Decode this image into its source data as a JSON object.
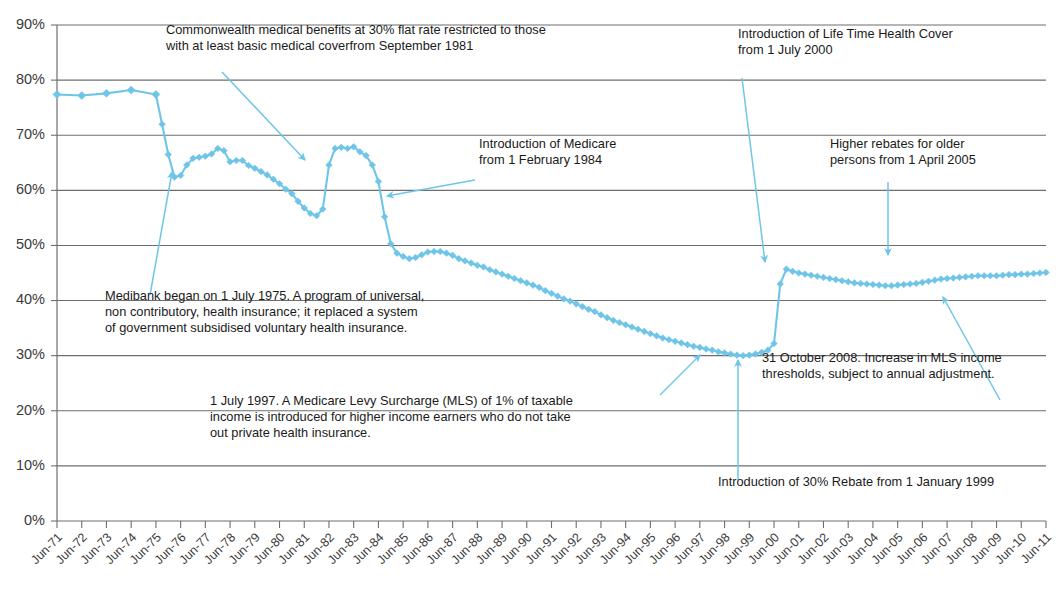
{
  "chart_data": {
    "type": "line",
    "title": "",
    "subtitle": "",
    "xlabel": "",
    "ylabel": "",
    "ylim": [
      0,
      90
    ],
    "yticks": [
      0,
      10,
      20,
      30,
      40,
      50,
      60,
      70,
      80,
      90
    ],
    "ytick_labels": [
      "0%",
      "10%",
      "20%",
      "30%",
      "40%",
      "50%",
      "60%",
      "70%",
      "80%",
      "90%"
    ],
    "grid": true,
    "legend": "none",
    "series_color": "#6FC5E8",
    "marker": "diamond",
    "categories": [
      "Jun-71",
      "Jun-72",
      "Jun-73",
      "Jun-74",
      "Jun-75",
      "Jun-76",
      "Jun-77",
      "Jun-78",
      "Jun-79",
      "Jun-80",
      "Jun-81",
      "Jun-82",
      "Jun-83",
      "Jun-84",
      "Jun-85",
      "Jun-86",
      "Jun-87",
      "Jun-88",
      "Jun-89",
      "Jun-90",
      "Jun-91",
      "Jun-92",
      "Jun-93",
      "Jun-94",
      "Jun-95",
      "Jun-96",
      "Jun-97",
      "Jun-98",
      "Jun-99",
      "Jun-00",
      "Jun-01",
      "Jun-02",
      "Jun-03",
      "Jun-04",
      "Jun-05",
      "Jun-06",
      "Jun-07",
      "Jun-08",
      "Jun-09",
      "Jun-10",
      "Jun-11"
    ],
    "series": [
      {
        "name": "Persons covered by private health insurance (hospital treatment)",
        "points": [
          {
            "x": "Jun-71",
            "y": 77.4
          },
          {
            "x": "Jun-72",
            "y": 77.2
          },
          {
            "x": "Jun-73",
            "y": 77.6
          },
          {
            "x": "Jun-74",
            "y": 78.2
          },
          {
            "x": "Jun-75",
            "y": 77.4
          },
          {
            "x": "Sep-75",
            "y": 72.0
          },
          {
            "x": "Dec-75",
            "y": 66.5
          },
          {
            "x": "Mar-76",
            "y": 62.4
          },
          {
            "x": "Jun-76",
            "y": 62.7
          },
          {
            "x": "Sep-76",
            "y": 64.6
          },
          {
            "x": "Dec-76",
            "y": 65.8
          },
          {
            "x": "Mar-77",
            "y": 66.0
          },
          {
            "x": "Jun-77",
            "y": 66.2
          },
          {
            "x": "Sep-77",
            "y": 66.6
          },
          {
            "x": "Dec-77",
            "y": 67.6
          },
          {
            "x": "Mar-78",
            "y": 67.2
          },
          {
            "x": "Jun-78",
            "y": 65.2
          },
          {
            "x": "Sep-78",
            "y": 65.4
          },
          {
            "x": "Dec-78",
            "y": 65.4
          },
          {
            "x": "Mar-79",
            "y": 64.5
          },
          {
            "x": "Jun-79",
            "y": 64.0
          },
          {
            "x": "Sep-79",
            "y": 63.4
          },
          {
            "x": "Dec-79",
            "y": 62.8
          },
          {
            "x": "Mar-80",
            "y": 62.0
          },
          {
            "x": "Jun-80",
            "y": 61.2
          },
          {
            "x": "Sep-80",
            "y": 60.2
          },
          {
            "x": "Dec-80",
            "y": 59.4
          },
          {
            "x": "Mar-81",
            "y": 58.0
          },
          {
            "x": "Jun-81",
            "y": 56.8
          },
          {
            "x": "Sep-81",
            "y": 55.8
          },
          {
            "x": "Dec-81",
            "y": 55.4
          },
          {
            "x": "Mar-82",
            "y": 56.6
          },
          {
            "x": "Jun-82",
            "y": 64.6
          },
          {
            "x": "Sep-82",
            "y": 67.6
          },
          {
            "x": "Dec-82",
            "y": 67.8
          },
          {
            "x": "Mar-83",
            "y": 67.6
          },
          {
            "x": "Jun-83",
            "y": 67.9
          },
          {
            "x": "Sep-83",
            "y": 67.0
          },
          {
            "x": "Dec-83",
            "y": 66.3
          },
          {
            "x": "Mar-84",
            "y": 64.6
          },
          {
            "x": "Jun-84",
            "y": 61.6
          },
          {
            "x": "Sep-84",
            "y": 55.2
          },
          {
            "x": "Dec-84",
            "y": 50.3
          },
          {
            "x": "Mar-85",
            "y": 48.6
          },
          {
            "x": "Jun-85",
            "y": 48.0
          },
          {
            "x": "Sep-85",
            "y": 47.6
          },
          {
            "x": "Dec-85",
            "y": 47.8
          },
          {
            "x": "Mar-86",
            "y": 48.3
          },
          {
            "x": "Jun-86",
            "y": 48.8
          },
          {
            "x": "Sep-86",
            "y": 48.9
          },
          {
            "x": "Dec-86",
            "y": 48.9
          },
          {
            "x": "Mar-87",
            "y": 48.6
          },
          {
            "x": "Jun-87",
            "y": 48.2
          },
          {
            "x": "Sep-87",
            "y": 47.6
          },
          {
            "x": "Dec-87",
            "y": 47.2
          },
          {
            "x": "Mar-88",
            "y": 46.8
          },
          {
            "x": "Jun-88",
            "y": 46.4
          },
          {
            "x": "Sep-88",
            "y": 46.1
          },
          {
            "x": "Dec-88",
            "y": 45.6
          },
          {
            "x": "Mar-89",
            "y": 45.2
          },
          {
            "x": "Jun-89",
            "y": 44.8
          },
          {
            "x": "Sep-89",
            "y": 44.4
          },
          {
            "x": "Dec-89",
            "y": 44.0
          },
          {
            "x": "Mar-90",
            "y": 43.6
          },
          {
            "x": "Jun-90",
            "y": 43.2
          },
          {
            "x": "Sep-90",
            "y": 42.8
          },
          {
            "x": "Dec-90",
            "y": 42.4
          },
          {
            "x": "Mar-91",
            "y": 41.8
          },
          {
            "x": "Jun-91",
            "y": 41.3
          },
          {
            "x": "Sep-91",
            "y": 40.8
          },
          {
            "x": "Dec-91",
            "y": 40.3
          },
          {
            "x": "Mar-92",
            "y": 39.9
          },
          {
            "x": "Jun-92",
            "y": 39.4
          },
          {
            "x": "Sep-92",
            "y": 38.9
          },
          {
            "x": "Dec-92",
            "y": 38.4
          },
          {
            "x": "Mar-93",
            "y": 38.0
          },
          {
            "x": "Jun-93",
            "y": 37.4
          },
          {
            "x": "Sep-93",
            "y": 36.9
          },
          {
            "x": "Dec-93",
            "y": 36.4
          },
          {
            "x": "Mar-94",
            "y": 36.0
          },
          {
            "x": "Jun-94",
            "y": 35.6
          },
          {
            "x": "Sep-94",
            "y": 35.2
          },
          {
            "x": "Dec-94",
            "y": 34.8
          },
          {
            "x": "Mar-95",
            "y": 34.4
          },
          {
            "x": "Jun-95",
            "y": 34.0
          },
          {
            "x": "Sep-95",
            "y": 33.6
          },
          {
            "x": "Dec-95",
            "y": 33.2
          },
          {
            "x": "Mar-96",
            "y": 32.9
          },
          {
            "x": "Jun-96",
            "y": 32.6
          },
          {
            "x": "Sep-96",
            "y": 32.3
          },
          {
            "x": "Dec-96",
            "y": 32.0
          },
          {
            "x": "Mar-97",
            "y": 31.7
          },
          {
            "x": "Jun-97",
            "y": 31.5
          },
          {
            "x": "Sep-97",
            "y": 31.2
          },
          {
            "x": "Dec-97",
            "y": 31.0
          },
          {
            "x": "Mar-98",
            "y": 30.7
          },
          {
            "x": "Jun-98",
            "y": 30.5
          },
          {
            "x": "Sep-98",
            "y": 30.3
          },
          {
            "x": "Dec-98",
            "y": 30.1
          },
          {
            "x": "Mar-99",
            "y": 30.0
          },
          {
            "x": "Jun-99",
            "y": 30.1
          },
          {
            "x": "Sep-99",
            "y": 30.3
          },
          {
            "x": "Dec-99",
            "y": 30.6
          },
          {
            "x": "Mar-00",
            "y": 31.0
          },
          {
            "x": "Jun-00",
            "y": 32.2
          },
          {
            "x": "Sep-00",
            "y": 43.0
          },
          {
            "x": "Dec-00",
            "y": 45.7
          },
          {
            "x": "Mar-01",
            "y": 45.3
          },
          {
            "x": "Jun-01",
            "y": 45.0
          },
          {
            "x": "Sep-01",
            "y": 44.8
          },
          {
            "x": "Dec-01",
            "y": 44.6
          },
          {
            "x": "Mar-02",
            "y": 44.4
          },
          {
            "x": "Jun-02",
            "y": 44.2
          },
          {
            "x": "Sep-02",
            "y": 44.0
          },
          {
            "x": "Dec-02",
            "y": 43.8
          },
          {
            "x": "Mar-03",
            "y": 43.6
          },
          {
            "x": "Jun-03",
            "y": 43.4
          },
          {
            "x": "Sep-03",
            "y": 43.2
          },
          {
            "x": "Dec-03",
            "y": 43.1
          },
          {
            "x": "Mar-04",
            "y": 43.0
          },
          {
            "x": "Jun-04",
            "y": 42.9
          },
          {
            "x": "Sep-04",
            "y": 42.8
          },
          {
            "x": "Dec-04",
            "y": 42.7
          },
          {
            "x": "Mar-05",
            "y": 42.7
          },
          {
            "x": "Jun-05",
            "y": 42.8
          },
          {
            "x": "Sep-05",
            "y": 42.9
          },
          {
            "x": "Dec-05",
            "y": 43.0
          },
          {
            "x": "Mar-06",
            "y": 43.1
          },
          {
            "x": "Jun-06",
            "y": 43.3
          },
          {
            "x": "Sep-06",
            "y": 43.5
          },
          {
            "x": "Dec-06",
            "y": 43.7
          },
          {
            "x": "Mar-07",
            "y": 43.9
          },
          {
            "x": "Jun-07",
            "y": 44.0
          },
          {
            "x": "Sep-07",
            "y": 44.1
          },
          {
            "x": "Dec-07",
            "y": 44.2
          },
          {
            "x": "Mar-08",
            "y": 44.3
          },
          {
            "x": "Jun-08",
            "y": 44.4
          },
          {
            "x": "Sep-08",
            "y": 44.5
          },
          {
            "x": "Dec-08",
            "y": 44.5
          },
          {
            "x": "Mar-09",
            "y": 44.5
          },
          {
            "x": "Jun-09",
            "y": 44.5
          },
          {
            "x": "Sep-09",
            "y": 44.6
          },
          {
            "x": "Dec-09",
            "y": 44.7
          },
          {
            "x": "Mar-10",
            "y": 44.7
          },
          {
            "x": "Jun-10",
            "y": 44.8
          },
          {
            "x": "Sep-10",
            "y": 44.8
          },
          {
            "x": "Dec-10",
            "y": 44.9
          },
          {
            "x": "Mar-11",
            "y": 45.0
          },
          {
            "x": "Jun-11",
            "y": 45.1
          }
        ]
      }
    ],
    "annotations": [
      {
        "id": "commonwealth-benefits",
        "lines": [
          "Commonwealth medical benefits at 30% flat rate restricted to those",
          "with at least basic medical coverfrom September 1981"
        ],
        "text_x": 166,
        "text_y": 34,
        "arrow_from": [
          222,
          72
        ],
        "arrow_to": [
          305,
          160
        ]
      },
      {
        "id": "life-time-health-cover",
        "lines": [
          "Introduction of Life Time Health Cover",
          "from 1 July 2000"
        ],
        "text_x": 738,
        "text_y": 38,
        "arrow_from": [
          742,
          78
        ],
        "arrow_to": [
          765,
          262
        ]
      },
      {
        "id": "introduction-of-medicare",
        "lines": [
          "Introduction of Medicare",
          "from 1 February 1984"
        ],
        "text_x": 479,
        "text_y": 148,
        "arrow_from": [
          475,
          180
        ],
        "arrow_to": [
          387,
          196
        ]
      },
      {
        "id": "higher-rebates-older-persons",
        "lines": [
          "Higher rebates for older",
          "persons from 1 April 2005"
        ],
        "text_x": 830,
        "text_y": 148,
        "arrow_from": [
          888,
          182
        ],
        "arrow_to": [
          888,
          255
        ]
      },
      {
        "id": "medibank-began",
        "lines": [
          "Medibank began on 1 July 1975.  A program of universal,",
          "non contributory, health insurance; it replaced a system",
          "of government subsidised voluntary health insurance."
        ],
        "text_x": 105,
        "text_y": 300,
        "arrow_from": [
          150,
          295
        ],
        "arrow_to": [
          172,
          172
        ]
      },
      {
        "id": "medicare-levy-surcharge",
        "lines": [
          "1 July 1997. A Medicare Levy Surcharge (MLS) of 1% of taxable",
          "income is introduced for higher income earners who do not take",
          "out private health insurance."
        ],
        "text_x": 210,
        "text_y": 405,
        "arrow_from": [
          660,
          395
        ],
        "arrow_to": [
          700,
          355
        ]
      },
      {
        "id": "mls-income-thresholds-2008",
        "lines": [
          "31 October 2008. Increase in MLS income",
          "thresholds, subject to annual adjustment."
        ],
        "text_x": 762,
        "text_y": 362,
        "arrow_from": [
          1000,
          400
        ],
        "arrow_to": [
          943,
          297
        ]
      },
      {
        "id": "thirty-percent-rebate",
        "lines": [
          "Introduction of 30% Rebate from 1 January 1999"
        ],
        "text_x": 718,
        "text_y": 486,
        "arrow_from": [
          738,
          480
        ],
        "arrow_to": [
          738,
          360
        ]
      }
    ]
  },
  "axes": {
    "plot_left": 57,
    "plot_right": 1046,
    "plot_top": 25,
    "plot_bottom": 521
  }
}
